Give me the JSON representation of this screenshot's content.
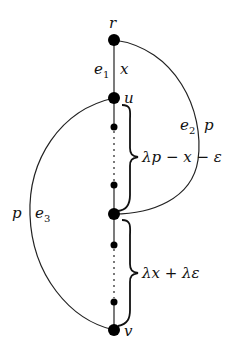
{
  "diagram": {
    "type": "graph",
    "nodes": {
      "r": "r",
      "u": "u",
      "v": "v"
    },
    "edge_labels": {
      "e1": {
        "name": "e",
        "sub": "1",
        "weight": "x"
      },
      "e2": {
        "name": "e",
        "sub": "2",
        "weight": "p"
      },
      "e3": {
        "name": "e",
        "sub": "3",
        "weight": "p"
      }
    },
    "brace_labels": {
      "upper": "λp − x − ε",
      "lower": "λx + λε"
    }
  }
}
